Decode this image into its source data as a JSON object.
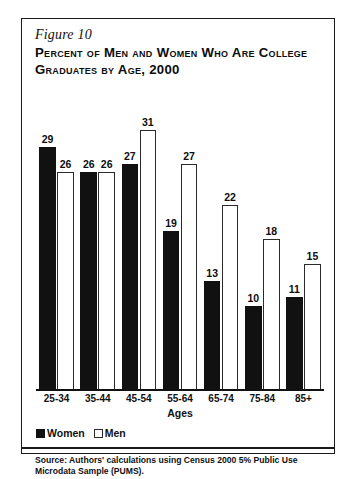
{
  "figure": {
    "number_label": "Figure 10",
    "title": "Percent of Men and Women Who Are College Graduates by Age, 2000",
    "source_note": "Source: Authors' calculations using Census 2000 5% Public Use Microdata Sample (PUMS)."
  },
  "legend": {
    "women_label": "Women",
    "men_label": "Men"
  },
  "chart_data": {
    "type": "bar",
    "title": "Percent of Men and Women Who Are College Graduates by Age, 2000",
    "xlabel": "Ages",
    "ylabel": "",
    "categories": [
      "25-34",
      "35-44",
      "45-54",
      "55-64",
      "65-74",
      "75-84",
      "85+"
    ],
    "series": [
      {
        "name": "Women",
        "color": "#111111",
        "values": [
          29,
          26,
          27,
          19,
          13,
          10,
          11
        ]
      },
      {
        "name": "Men",
        "color": "#ffffff",
        "values": [
          26,
          26,
          31,
          27,
          22,
          18,
          15
        ]
      }
    ],
    "ylim": [
      0,
      35
    ],
    "grid": false,
    "legend_position": "bottom-left",
    "data_labels": true
  }
}
